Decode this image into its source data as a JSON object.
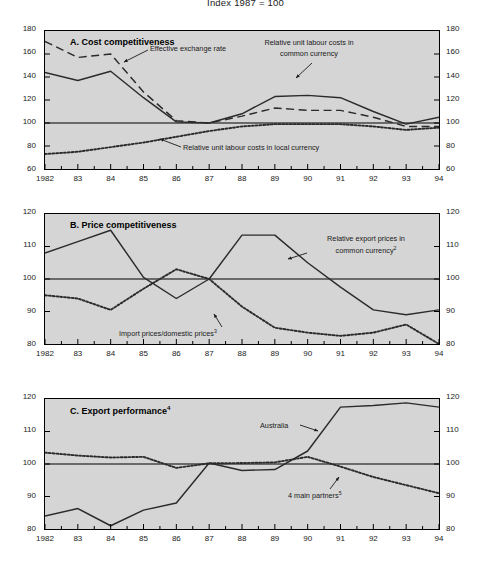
{
  "figure": {
    "title": "Index 1987 = 100",
    "background": "#d5d5d5",
    "line_color": "#2b2b2b"
  },
  "chart_data": [
    {
      "type": "line",
      "panel": "A",
      "title": "A.   Cost competitiveness",
      "title_plain": "Cost competitiveness",
      "xlabel": "",
      "ylabel": "",
      "ylim": [
        60,
        180
      ],
      "yticks": [
        60,
        80,
        100,
        120,
        140,
        160,
        180
      ],
      "xlim": [
        1982,
        1994
      ],
      "grid": false,
      "reference_line": 100,
      "x": [
        1982,
        1983,
        1984,
        1985,
        1986,
        1987,
        1988,
        1989,
        1990,
        1991,
        1992,
        1993,
        1994
      ],
      "xticklabels": [
        "1982",
        "83",
        "84",
        "85",
        "86",
        "87",
        "88",
        "89",
        "90",
        "91",
        "92",
        "93",
        "94"
      ],
      "series": [
        {
          "name": "Relative unit labour costs in common currency",
          "style": "solid",
          "values": [
            144,
            137,
            145,
            122,
            101,
            100,
            108,
            123,
            124,
            122,
            110,
            99,
            105
          ]
        },
        {
          "name": "Effective exchange rate",
          "style": "dashed",
          "values": [
            171,
            157,
            160,
            127,
            102,
            100,
            106,
            113,
            111,
            111,
            105,
            97,
            97
          ]
        },
        {
          "name": "Relative unit labour costs in local currency",
          "style": "dotted",
          "values": [
            73,
            75,
            79,
            83,
            88,
            93,
            97,
            99,
            99,
            99,
            97,
            94,
            96
          ]
        }
      ],
      "annotations": [
        {
          "text": "Effective exchange rate",
          "series": "Effective exchange rate"
        },
        {
          "text": "Relative unit labour costs in",
          "text2": "common currency",
          "series": "Relative unit labour costs in common currency"
        },
        {
          "text": "Relative unit labour costs in local currency",
          "series": "Relative unit labour costs in local currency"
        }
      ]
    },
    {
      "type": "line",
      "panel": "B",
      "title": "B.   Price competitiveness",
      "title_plain": "Price competitiveness",
      "xlabel": "",
      "ylabel": "",
      "ylim": [
        80,
        120
      ],
      "yticks": [
        80,
        90,
        100,
        110,
        120
      ],
      "xlim": [
        1982,
        1994
      ],
      "grid": false,
      "reference_line": 100,
      "x": [
        1982,
        1983,
        1984,
        1985,
        1986,
        1987,
        1988,
        1989,
        1990,
        1991,
        1992,
        1993,
        1994
      ],
      "xticklabels": [
        "1982",
        "83",
        "84",
        "85",
        "86",
        "87",
        "88",
        "89",
        "90",
        "91",
        "92",
        "93",
        "94"
      ],
      "series": [
        {
          "name": "Relative export prices in common currency",
          "superscript": "2",
          "style": "solid",
          "values": [
            108,
            111.5,
            115,
            100.5,
            94,
            100,
            113.5,
            113.5,
            105,
            97.5,
            90.5,
            89,
            90.5
          ]
        },
        {
          "name": "Import prices/domestic prices",
          "superscript": "3",
          "style": "dotted",
          "values": [
            95,
            94,
            90.5,
            97,
            103,
            100,
            91.5,
            85,
            83.5,
            82.5,
            83.5,
            86,
            80
          ]
        }
      ],
      "annotations": [
        {
          "text": "Relative export prices in",
          "text2": "common currency",
          "sup": "2",
          "series": "Relative export prices in common currency"
        },
        {
          "text": "Import prices/domestic prices",
          "sup": "3",
          "series": "Import prices/domestic prices"
        }
      ]
    },
    {
      "type": "line",
      "panel": "C",
      "title": "C.   Export performance",
      "title_plain": "Export performance",
      "title_superscript": "4",
      "xlabel": "",
      "ylabel": "",
      "ylim": [
        80,
        120
      ],
      "yticks": [
        80,
        90,
        100,
        110,
        120
      ],
      "xlim": [
        1982,
        1994
      ],
      "grid": false,
      "reference_line": 100,
      "x": [
        1982,
        1983,
        1984,
        1985,
        1986,
        1987,
        1988,
        1989,
        1990,
        1991,
        1992,
        1993,
        1994
      ],
      "xticklabels": [
        "1982",
        "83",
        "84",
        "85",
        "86",
        "87",
        "88",
        "89",
        "90",
        "91",
        "92",
        "93",
        "94"
      ],
      "series": [
        {
          "name": "Australia",
          "style": "solid",
          "values": [
            84,
            86.3,
            81,
            85.8,
            88,
            100.3,
            98,
            98.3,
            104,
            117.5,
            118,
            118.8,
            117.5
          ]
        },
        {
          "name": "4 main partners",
          "superscript": "5",
          "style": "dotted",
          "values": [
            103.5,
            102.6,
            102,
            102.2,
            98.8,
            100.2,
            100.3,
            100.5,
            102.2,
            99.2,
            96,
            93.5,
            91
          ]
        }
      ],
      "annotations": [
        {
          "text": "Australia",
          "series": "Australia"
        },
        {
          "text": "4 main partners",
          "sup": "5",
          "series": "4 main partners"
        }
      ]
    }
  ]
}
